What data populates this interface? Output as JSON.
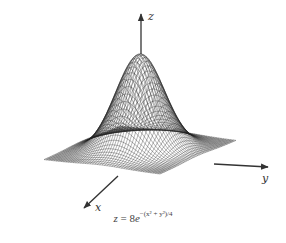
{
  "figure": {
    "surface_function": "8*exp(-(x^2+y^2)/4)",
    "domain": {
      "x": [
        -4,
        4
      ],
      "y": [
        -4,
        4
      ]
    },
    "grid_lines": 48,
    "mesh_color": "#222222",
    "axis_color": "#333333",
    "background": "#ffffff"
  },
  "axes": {
    "z": {
      "label": "z"
    },
    "y": {
      "label": "y"
    },
    "x": {
      "label": "x"
    }
  },
  "caption": {
    "lhs": "z",
    "equals": " = 8",
    "base": "e",
    "exponent": "−(x² + y²)/4"
  }
}
